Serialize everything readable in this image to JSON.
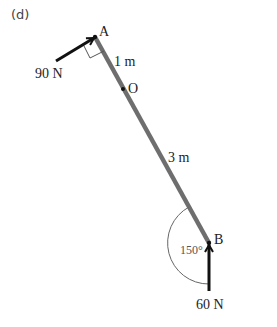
{
  "panel_label": "(d)",
  "points": {
    "A": {
      "label": "A",
      "x": 95,
      "y": 37
    },
    "O": {
      "label": "O",
      "x": 123,
      "y": 89
    },
    "B": {
      "label": "B",
      "x": 209,
      "y": 243
    }
  },
  "segments": {
    "AO": {
      "length_label": "1 m"
    },
    "OB": {
      "length_label": "3 m"
    }
  },
  "forces": {
    "at_A": {
      "magnitude_label": "90 N",
      "direction": "perpendicular to rod"
    },
    "at_B": {
      "magnitude_label": "60 N",
      "direction": "vertical up"
    }
  },
  "angle_at_B": {
    "label": "150°"
  },
  "colors": {
    "rod": "#6e6e6e",
    "arrow": "#111111",
    "arc": "#666666"
  }
}
